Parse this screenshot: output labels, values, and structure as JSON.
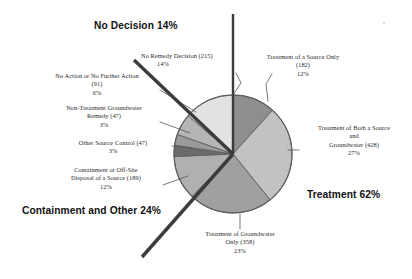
{
  "chart_data": {
    "type": "pie",
    "title": "",
    "subtitle": "",
    "xlabel": "",
    "ylabel": "",
    "legend_position": "none",
    "grid": false,
    "total_sites": 1557,
    "units": "sites",
    "categories": [
      "Treatment of a Source Only",
      "Treatment of Both a Source and Groundwater",
      "Treatment of Groundwater Only",
      "Containment or Off-Site Disposal of a Source",
      "Other Source Control",
      "Non-Treatment Groundwater Remedy",
      "No Action or No Further Action",
      "No Remedy Decision"
    ],
    "values": [
      182,
      428,
      358,
      189,
      47,
      47,
      91,
      215
    ],
    "percents": [
      12,
      27,
      23,
      12,
      3,
      3,
      6,
      14
    ],
    "colors": [
      "#8e8e8e",
      "#c2c2c2",
      "#a0a0a0",
      "#b0b0b0",
      "#6b6b6b",
      "#9a9a9a",
      "#b5b5b5",
      "#e2e2e2"
    ],
    "slices": [
      {
        "label": "Treatment of a Source Only",
        "value": 182,
        "percent": 12,
        "color": "#8e8e8e",
        "start_deg": 0,
        "end_deg": 42.1
      },
      {
        "label": "Treatment of Both a Source and Groundwater",
        "value": 428,
        "percent": 27,
        "color": "#c2c2c2",
        "start_deg": 42.1,
        "end_deg": 141.1
      },
      {
        "label": "Treatment of Groundwater Only",
        "value": 358,
        "percent": 23,
        "color": "#a0a0a0",
        "start_deg": 141.1,
        "end_deg": 223.9
      },
      {
        "label": "Containment or Off-Site Disposal of a Source",
        "value": 189,
        "percent": 12,
        "color": "#b0b0b0",
        "start_deg": 223.9,
        "end_deg": 267.6
      },
      {
        "label": "Other Source Control",
        "value": 47,
        "percent": 3,
        "color": "#6b6b6b",
        "start_deg": 267.6,
        "end_deg": 278.5
      },
      {
        "label": "Non-Treatment Groundwater Remedy",
        "value": 47,
        "percent": 3,
        "color": "#9a9a9a",
        "start_deg": 278.5,
        "end_deg": 289.4
      },
      {
        "label": "No Action or No Further Action",
        "value": 91,
        "percent": 6,
        "color": "#b5b5b5",
        "start_deg": 289.4,
        "end_deg": 310.4
      },
      {
        "label": "No Remedy Decision",
        "value": 215,
        "percent": 14,
        "color": "#e2e2e2",
        "start_deg": 310.4,
        "end_deg": 360
      }
    ],
    "groups": [
      {
        "name": "Treatment",
        "percent_label": "Treatment 62%",
        "percent": 62
      },
      {
        "name": "Containment and Other",
        "percent_label": "Containment and Other 24%",
        "percent": 24
      },
      {
        "name": "No Decision",
        "percent_label": "No Decision 14%",
        "percent": 14
      }
    ]
  },
  "headers": {
    "no_decision": "No Decision 14%",
    "containment_other": "Containment and Other 24%",
    "treatment": "Treatment 62%"
  },
  "labels": {
    "no_remedy_decision": {
      "line1": "No Remedy Decision (215)",
      "line2": "14%"
    },
    "no_action": {
      "line1": "No Action or No Further Action",
      "line2": "(91)",
      "line3": "6%"
    },
    "non_treatment_gw": {
      "line1": "Non-Treatment Groundwater",
      "line2": "Remedy (47)",
      "line3": "3%"
    },
    "other_source_control": {
      "line1": "Other Source Control (47)",
      "line2": "3%"
    },
    "containment_offsite": {
      "line1": "Containment or Off-Site",
      "line2": "Disposal of a Source (189)",
      "line3": "12%"
    },
    "treatment_source_only": {
      "line1": "Treatment of a Source Only",
      "line2": "(182)",
      "line3": "12%"
    },
    "treatment_both": {
      "line1": "Treatment of Both a  Source",
      "line2": "and",
      "line3": "Groundwater (428)",
      "line4": "27%"
    },
    "treatment_gw_only": {
      "line1": "Treatment of Groundwater",
      "line2": "Only (358)",
      "line3": "23%"
    }
  }
}
